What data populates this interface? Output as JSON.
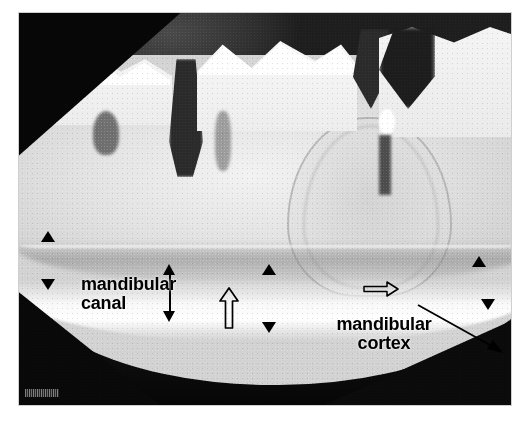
{
  "figure": {
    "type": "radiograph",
    "modality": "dental panoramic / intraoral radiograph",
    "background_color": "#ffffff",
    "plate": {
      "background_color": "#0a0a0a",
      "bone_color": "#e6e6e6",
      "cortex_color": "#fafafa",
      "canal_color": "#8a8a8a"
    }
  },
  "annotations": {
    "labels": [
      {
        "id": "mandibular-canal",
        "text": "mandibular\ncanal",
        "color": "#000000",
        "x": 62,
        "y": 262
      },
      {
        "id": "mandibular-cortex",
        "text": "mandibular\ncortex",
        "color": "#000000",
        "x": 306,
        "y": 302
      }
    ],
    "markers": [
      {
        "id": "canal-left-superior",
        "shape": "triangle-up",
        "x": 40,
        "y": 230,
        "color": "#000000"
      },
      {
        "id": "canal-left-inferior",
        "shape": "triangle-down",
        "x": 40,
        "y": 278,
        "color": "#000000"
      },
      {
        "id": "canal-mid-superior",
        "shape": "triangle-up",
        "x": 261,
        "y": 263,
        "color": "#000000"
      },
      {
        "id": "canal-mid-inferior",
        "shape": "triangle-down",
        "x": 261,
        "y": 321,
        "color": "#000000"
      },
      {
        "id": "canal-right-superior",
        "shape": "triangle-up",
        "x": 471,
        "y": 255,
        "color": "#000000"
      },
      {
        "id": "canal-right-inferior",
        "shape": "triangle-down",
        "x": 480,
        "y": 298,
        "color": "#000000"
      }
    ],
    "arrows": [
      {
        "id": "canal-height-double-arrow",
        "shape": "double-headed-vertical-arrow",
        "x": 164,
        "y": 263,
        "length": 58,
        "style": "solid",
        "color": "#000000"
      },
      {
        "id": "canal-roof-hollow-arrow",
        "shape": "hollow-arrow-up",
        "x": 219,
        "y": 286,
        "length": 40,
        "style": "outline",
        "color": "#000000"
      },
      {
        "id": "cortex-hollow-arrow",
        "shape": "hollow-arrow-right",
        "x": 362,
        "y": 280,
        "length": 34,
        "style": "outline",
        "color": "#000000"
      },
      {
        "id": "cortex-leader-arrow",
        "shape": "leader-arrow",
        "from_x": 424,
        "from_y": 306,
        "to_x": 492,
        "to_y": 352,
        "style": "solid-thin",
        "color": "#000000"
      }
    ],
    "id_stamp": {
      "id": "burned-in-identifier",
      "text": "",
      "legible": false,
      "x": 24,
      "y": 390
    }
  }
}
